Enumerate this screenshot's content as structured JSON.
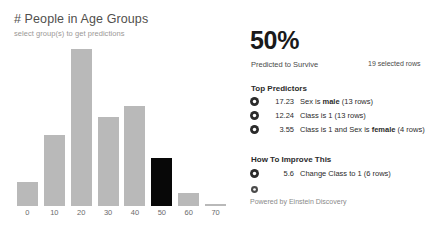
{
  "chart_panel": {
    "title": "# People in Age Groups",
    "subtitle": "select group(s) to get predictions"
  },
  "chart_data": {
    "type": "bar",
    "title": "# People in Age Groups",
    "subtitle": "select group(s) to get predictions",
    "xlabel": "",
    "ylabel": "",
    "categories": [
      "0",
      "10",
      "20",
      "30",
      "40",
      "50",
      "60",
      "70"
    ],
    "values": [
      24,
      70,
      155,
      88,
      99,
      47,
      13,
      2
    ],
    "ylim": [
      0,
      160
    ],
    "grid": false,
    "legend": false,
    "selected_category": "50",
    "bar_color": "#b9b9b9",
    "selected_bar_color": "#080808"
  },
  "insights": {
    "headline": "50%",
    "headline_caption": "Predicted to Survive",
    "selected_rows": "19 selected rows",
    "top_predictors_heading": "Top Predictors",
    "top_predictors": [
      {
        "value": "17.23",
        "prefix": "Sex is ",
        "emphasis": "male",
        "suffix": " (13 rows)"
      },
      {
        "value": "12.24",
        "prefix": "Class is 1",
        "emphasis": "",
        "suffix": " (13 rows)"
      },
      {
        "value": "3.55",
        "prefix": "Class is 1 and Sex is ",
        "emphasis": "female",
        "suffix": " (4 rows)"
      }
    ],
    "improve_heading": "How To Improve This",
    "improvements": [
      {
        "value": "5.6",
        "prefix": "Change Class to 1",
        "emphasis": "",
        "suffix": " (6 rows)"
      }
    ],
    "footer": "Powered by Einstein Discovery"
  }
}
